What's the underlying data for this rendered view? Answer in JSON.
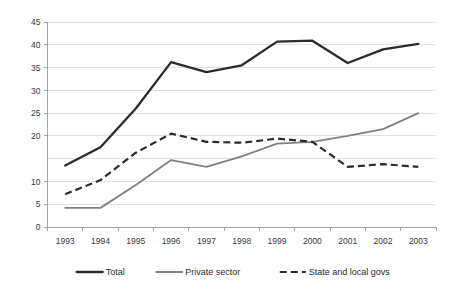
{
  "chart_data": {
    "type": "line",
    "title": "",
    "xlabel": "",
    "ylabel": "",
    "categories": [
      "1993",
      "1994",
      "1995",
      "1996",
      "1997",
      "1998",
      "1999",
      "2000",
      "2001",
      "2002",
      "2003"
    ],
    "ylim": [
      0,
      45
    ],
    "ytick_step": 5,
    "yticks": [
      "0",
      "5",
      "10",
      "15",
      "20",
      "25",
      "30",
      "35",
      "40",
      "45"
    ],
    "ytick_labels_shown": [
      "0",
      "5",
      "10",
      "20",
      "25",
      "30",
      "35",
      "40",
      "45"
    ],
    "grid": true,
    "grid_axis": "y",
    "legend_position": "bottom",
    "series": [
      {
        "name": "Total",
        "style": "solid-thick",
        "color": "#2b2b2b",
        "values": [
          13.5,
          17.5,
          26.0,
          36.2,
          34.0,
          35.5,
          40.7,
          40.9,
          36.0,
          39.0,
          40.2
        ]
      },
      {
        "name": "Private sector",
        "style": "solid-gray",
        "color": "#808080",
        "values": [
          4.2,
          4.2,
          9.2,
          14.7,
          13.2,
          15.5,
          18.3,
          18.7,
          20.0,
          21.5,
          25.0
        ]
      },
      {
        "name": "State and local govs",
        "style": "dashed",
        "color": "#2b2b2b",
        "values": [
          7.2,
          10.3,
          16.3,
          20.5,
          18.7,
          18.5,
          19.4,
          18.7,
          13.2,
          13.8,
          13.2
        ]
      }
    ]
  },
  "axis": {
    "y_labels": [
      "45",
      "40",
      "35",
      "30",
      "25",
      "20",
      "15",
      "10",
      "5",
      "0"
    ],
    "x_labels": [
      "1993",
      "1994",
      "1995",
      "1996",
      "1997",
      "1998",
      "1999",
      "2000",
      "2001",
      "2002",
      "2003"
    ]
  },
  "legend": {
    "items": [
      {
        "label": "Total"
      },
      {
        "label": "Private sector"
      },
      {
        "label": "State and local govs"
      }
    ]
  }
}
